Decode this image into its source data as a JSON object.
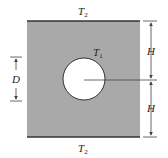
{
  "diagram": {
    "colors": {
      "plate_fill": "#a9a9a9",
      "edge": "#333333",
      "hole_fill": "#ffffff",
      "dim_line": "#444444"
    },
    "labels": {
      "top_temp": {
        "main": "T",
        "sub": "2"
      },
      "bottom_temp": {
        "main": "T",
        "sub": "2"
      },
      "hole_temp": {
        "main": "T",
        "sub": "1"
      },
      "diameter": "D",
      "upper_height": "H",
      "lower_height": "H"
    }
  }
}
